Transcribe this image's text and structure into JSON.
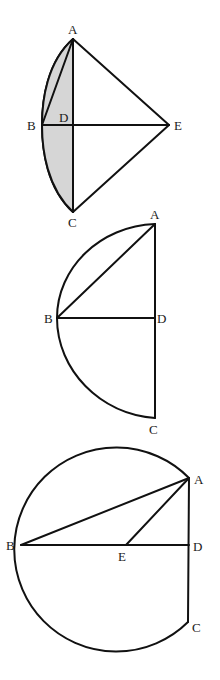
{
  "colors": {
    "stroke": "#111111",
    "shade": "#d6d6d6",
    "background": "#ffffff",
    "label": "#1a1a1a"
  },
  "figures": [
    {
      "id": "figure-1",
      "description": "Kite ABEC-like figure with arc from A through B to C, lens region between arc and AC shaded",
      "labels": {
        "A": "A",
        "B": "B",
        "C": "C",
        "D": "D",
        "E": "E"
      },
      "points": {
        "A": [
          73,
          39
        ],
        "B": [
          42,
          125
        ],
        "C": [
          73,
          212
        ],
        "D": [
          73,
          125
        ],
        "E": [
          169,
          125
        ]
      },
      "segments": [
        "AE",
        "EC",
        "AC",
        "BE",
        "AB"
      ],
      "arcs": [
        "A-B-C"
      ],
      "shaded": "region between arc ABC and chord AC"
    },
    {
      "id": "figure-2",
      "description": "Semicircle with diameter AC, radius BD perpendicular, chord AB",
      "labels": {
        "A": "A",
        "B": "B",
        "C": "C",
        "D": "D"
      },
      "points": {
        "A": [
          155,
          224
        ],
        "B": [
          57,
          318
        ],
        "C": [
          155,
          418
        ],
        "D": [
          155,
          318
        ]
      },
      "segments": [
        "AC",
        "BD",
        "AB"
      ],
      "arcs": [
        "A-B-C"
      ]
    },
    {
      "id": "figure-3",
      "description": "Circle arc from A around through B to C with center E, segments AB, AE, BD, AD, DC",
      "labels": {
        "A": "A",
        "B": "B",
        "C": "C",
        "D": "D",
        "E": "E"
      },
      "points": {
        "A": [
          189,
          478
        ],
        "B": [
          21,
          545
        ],
        "C": [
          188,
          622
        ],
        "D": [
          189,
          545
        ],
        "E": [
          126,
          545
        ]
      },
      "segments": [
        "AB",
        "AE",
        "BD",
        "AD",
        "DC"
      ],
      "arcs": [
        "A-top-B-bottom-C"
      ]
    }
  ]
}
